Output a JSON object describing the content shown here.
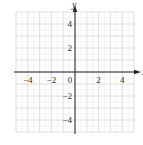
{
  "chart_data": {
    "type": "line",
    "title": "",
    "xlabel": "x",
    "ylabel": "y",
    "xlim": [
      -5,
      5
    ],
    "ylim": [
      -5,
      5
    ],
    "grid": true,
    "grid_step": 1,
    "x_ticks": [
      {
        "value": -4,
        "label": "−4"
      },
      {
        "value": -2,
        "label": "−2"
      },
      {
        "value": 0,
        "label": "0"
      },
      {
        "value": 2,
        "label": "2"
      },
      {
        "value": 4,
        "label": "4"
      }
    ],
    "y_ticks": [
      {
        "value": 4,
        "label": "4"
      },
      {
        "value": 2,
        "label": "2"
      },
      {
        "value": -2,
        "label": "−2"
      },
      {
        "value": -4,
        "label": "−4"
      }
    ],
    "series": []
  }
}
